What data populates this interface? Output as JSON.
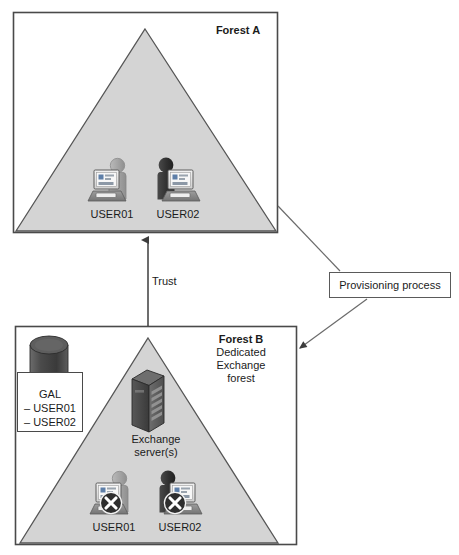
{
  "diagram": {
    "background_color": "#ffffff",
    "triangle_fill": "#d4d4d4",
    "triangle_stroke": "#4a4a4a",
    "box_stroke": "#4a4a4a",
    "text_color": "#1b1b1b"
  },
  "forest_a": {
    "label": "Forest A",
    "users": [
      {
        "name": "USER01",
        "icon": "user-at-computer-icon",
        "style": "light",
        "disabled": false
      },
      {
        "name": "USER02",
        "icon": "user-at-computer-icon",
        "style": "dark",
        "disabled": false
      }
    ]
  },
  "forest_b": {
    "label": "Forest B",
    "sublabel": "Dedicated\nExchange\nforest",
    "server": {
      "icon": "server-tower-icon",
      "caption": "Exchange\nserver(s)"
    },
    "gal": {
      "icon": "database-cylinder-icon",
      "title": "GAL",
      "items": "– USER01\n– USER02"
    },
    "users": [
      {
        "name": "USER01",
        "icon": "user-at-computer-icon",
        "style": "light",
        "disabled": true,
        "badge": "x-disabled-badge"
      },
      {
        "name": "USER02",
        "icon": "user-at-computer-icon",
        "style": "dark",
        "disabled": true,
        "badge": "x-disabled-badge"
      }
    ]
  },
  "connectors": {
    "trust": {
      "label": "Trust",
      "direction": "forest-b-to-forest-a",
      "arrow": true
    },
    "provisioning": {
      "label": "Provisioning process",
      "from_label": "Forest A",
      "to_label": "Forest B",
      "arrow": true
    }
  }
}
